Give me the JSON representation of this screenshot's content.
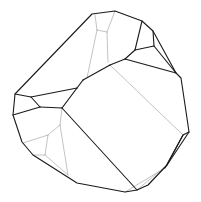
{
  "figure": {
    "label": "Crystal polyhedron line drawing",
    "background": "#ffffff",
    "dark_edge_color": "#1a1a1a",
    "light_edge_color": "#9a9a9a",
    "outline": [
      [
        92,
        14
      ],
      [
        115,
        11
      ],
      [
        142,
        21
      ],
      [
        153,
        31
      ],
      [
        176,
        73
      ],
      [
        181,
        78
      ],
      [
        188,
        125
      ],
      [
        189,
        132
      ],
      [
        183,
        135
      ],
      [
        167,
        165
      ],
      [
        148,
        185
      ],
      [
        137,
        190
      ],
      [
        125,
        192
      ],
      [
        77,
        183
      ],
      [
        33,
        155
      ],
      [
        22,
        142
      ],
      [
        13,
        115
      ],
      [
        15,
        94
      ],
      [
        92,
        14
      ]
    ],
    "dark_edges": [
      [
        [
          142,
          21
        ],
        [
          135,
          50
        ]
      ],
      [
        [
          153,
          31
        ],
        [
          154,
          46
        ]
      ],
      [
        [
          135,
          50
        ],
        [
          154,
          46
        ]
      ],
      [
        [
          154,
          46
        ],
        [
          176,
          73
        ]
      ],
      [
        [
          135,
          50
        ],
        [
          125,
          59
        ]
      ],
      [
        [
          125,
          59
        ],
        [
          176,
          73
        ]
      ],
      [
        [
          125,
          59
        ],
        [
          110,
          65
        ]
      ],
      [
        [
          110,
          65
        ],
        [
          83,
          80
        ]
      ],
      [
        [
          83,
          80
        ],
        [
          77,
          88
        ]
      ],
      [
        [
          77,
          88
        ],
        [
          62,
          108
        ]
      ],
      [
        [
          77,
          88
        ],
        [
          31,
          97
        ]
      ],
      [
        [
          15,
          94
        ],
        [
          31,
          97
        ]
      ],
      [
        [
          31,
          97
        ],
        [
          40,
          107
        ]
      ],
      [
        [
          40,
          107
        ],
        [
          62,
          108
        ]
      ],
      [
        [
          40,
          107
        ],
        [
          13,
          115
        ]
      ],
      [
        [
          62,
          108
        ],
        [
          137,
          190
        ]
      ],
      [
        [
          189,
          132
        ],
        [
          167,
          165
        ]
      ],
      [
        [
          183,
          135
        ],
        [
          165,
          168
        ]
      ]
    ],
    "light_edges": [
      [
        [
          95,
          15
        ],
        [
          97,
          30
        ]
      ],
      [
        [
          97,
          30
        ],
        [
          87,
          78
        ]
      ],
      [
        [
          115,
          11
        ],
        [
          107,
          32
        ]
      ],
      [
        [
          107,
          32
        ],
        [
          108,
          62
        ]
      ],
      [
        [
          97,
          30
        ],
        [
          107,
          32
        ]
      ],
      [
        [
          110,
          65
        ],
        [
          183,
          135
        ]
      ],
      [
        [
          83,
          80
        ],
        [
          62,
          108
        ]
      ],
      [
        [
          62,
          108
        ],
        [
          60,
          125
        ]
      ],
      [
        [
          60,
          125
        ],
        [
          48,
          135
        ]
      ],
      [
        [
          48,
          135
        ],
        [
          23,
          143
        ]
      ],
      [
        [
          60,
          125
        ],
        [
          68,
          175
        ]
      ],
      [
        [
          48,
          135
        ],
        [
          45,
          155
        ]
      ],
      [
        [
          45,
          155
        ],
        [
          33,
          155
        ]
      ],
      [
        [
          45,
          155
        ],
        [
          68,
          175
        ]
      ],
      [
        [
          125,
          192
        ],
        [
          165,
          168
        ]
      ],
      [
        [
          137,
          190
        ],
        [
          167,
          165
        ]
      ]
    ]
  }
}
